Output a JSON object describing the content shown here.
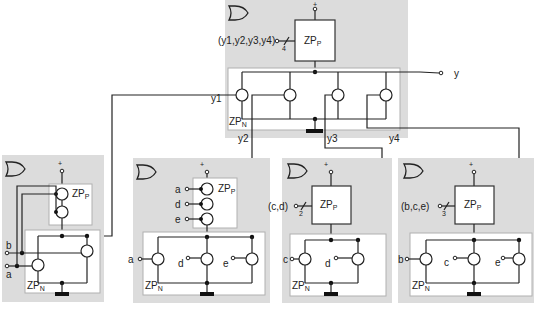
{
  "diagram": {
    "type": "switch-network / CMOS complex gate composition",
    "colors": {
      "background": "#ffffff",
      "module_fill": "#dcdcdc",
      "panel_fill": "#ffffff",
      "wire": "#222222"
    },
    "top_gate": {
      "symbol": "or-gate",
      "supply_label": "+",
      "pull_up_label": "ZP",
      "pull_up_sub": "P",
      "pull_down_label": "ZP",
      "pull_down_sub": "N",
      "bus_input_label": "(y1,y2,y3,y4)",
      "bus_width": "4",
      "output_label": "y",
      "internal_labels": {
        "y1": "y1",
        "y2": "y2",
        "y3": "y3",
        "y4": "y4"
      }
    },
    "sub_gates": [
      {
        "id": "y1",
        "symbol": "or-gate",
        "supply_label": "+",
        "pull_up_label": "ZP",
        "pull_up_sub": "P",
        "pull_down_label": "ZP",
        "pull_down_sub": "N",
        "inputs": [
          "b",
          "a"
        ],
        "pull_up_style": "series switches"
      },
      {
        "id": "y2",
        "symbol": "or-gate",
        "supply_label": "+",
        "pull_up_label": "ZP",
        "pull_up_sub": "P",
        "pull_down_label": "ZP",
        "pull_down_sub": "N",
        "pull_up_inputs": [
          "a",
          "d",
          "e"
        ],
        "pull_down_inputs": [
          "a",
          "d",
          "e"
        ],
        "pull_up_style": "series switches"
      },
      {
        "id": "y3",
        "symbol": "or-gate",
        "supply_label": "+",
        "pull_up_label": "ZP",
        "pull_up_sub": "P",
        "pull_down_label": "ZP",
        "pull_down_sub": "N",
        "bus_input_label": "(c,d)",
        "bus_width": "2",
        "pull_down_inputs": [
          "c",
          "d"
        ]
      },
      {
        "id": "y4",
        "symbol": "or-gate",
        "supply_label": "+",
        "pull_up_label": "ZP",
        "pull_up_sub": "P",
        "pull_down_label": "ZP",
        "pull_down_sub": "N",
        "bus_input_label": "(b,c,e)",
        "bus_width": "3",
        "pull_down_inputs": [
          "b",
          "c",
          "e"
        ]
      }
    ]
  }
}
